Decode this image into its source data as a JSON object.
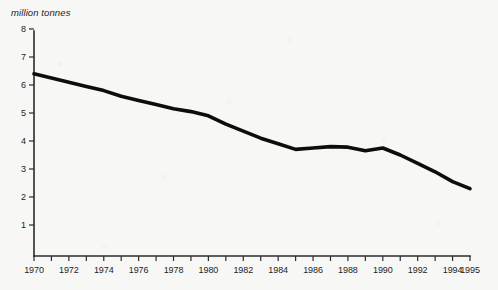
{
  "chart_data": {
    "type": "line",
    "title": "",
    "subtitle": "",
    "xlabel": "",
    "ylabel": "million tonnes",
    "unit_label": "million tonnes",
    "grid": false,
    "legend": false,
    "legend_position": "none",
    "xlim": [
      1970,
      1995
    ],
    "ylim": [
      0,
      8
    ],
    "y_ticks": [
      1,
      2,
      3,
      4,
      5,
      6,
      7,
      8
    ],
    "y_tick_labels": [
      "1",
      "2",
      "3",
      "4",
      "5",
      "6",
      "7",
      "8"
    ],
    "x_ticks": [
      1970,
      1971,
      1972,
      1973,
      1974,
      1975,
      1976,
      1977,
      1978,
      1979,
      1980,
      1981,
      1982,
      1983,
      1984,
      1985,
      1986,
      1987,
      1988,
      1989,
      1990,
      1991,
      1992,
      1993,
      1994,
      1995
    ],
    "x_tick_labels": [
      {
        "value": 1970,
        "label": "1970"
      },
      {
        "value": 1972,
        "label": "1972"
      },
      {
        "value": 1974,
        "label": "1974"
      },
      {
        "value": 1976,
        "label": "1976"
      },
      {
        "value": 1978,
        "label": "1978"
      },
      {
        "value": 1980,
        "label": "1980"
      },
      {
        "value": 1982,
        "label": "1982"
      },
      {
        "value": 1984,
        "label": "1984"
      },
      {
        "value": 1986,
        "label": "1986"
      },
      {
        "value": 1988,
        "label": "1988"
      },
      {
        "value": 1990,
        "label": "1990"
      },
      {
        "value": 1992,
        "label": "1992"
      },
      {
        "value": 1994,
        "label": "1994"
      },
      {
        "value": 1995,
        "label": "1995"
      }
    ],
    "x": [
      1970,
      1971,
      1972,
      1973,
      1974,
      1975,
      1976,
      1977,
      1978,
      1979,
      1980,
      1981,
      1982,
      1983,
      1984,
      1985,
      1986,
      1987,
      1988,
      1989,
      1990,
      1991,
      1992,
      1993,
      1994,
      1995
    ],
    "values": [
      6.4,
      6.25,
      6.1,
      5.95,
      5.8,
      5.6,
      5.45,
      5.3,
      5.15,
      5.05,
      4.9,
      4.6,
      4.35,
      4.1,
      3.9,
      3.7,
      3.75,
      3.8,
      3.78,
      3.65,
      3.75,
      3.5,
      3.2,
      2.9,
      2.55,
      2.3
    ],
    "series": [
      {
        "name": "million tonnes",
        "color": "#0d0d0d",
        "values": [
          6.4,
          6.25,
          6.1,
          5.95,
          5.8,
          5.6,
          5.45,
          5.3,
          5.15,
          5.05,
          4.9,
          4.6,
          4.35,
          4.1,
          3.9,
          3.7,
          3.75,
          3.8,
          3.78,
          3.65,
          3.75,
          3.5,
          3.2,
          2.9,
          2.55,
          2.3
        ]
      }
    ]
  },
  "colors": {
    "background": "#f7f7f5",
    "axis": "#2b2b2b",
    "line": "#0d0d0d",
    "text": "#1d1d1d"
  }
}
